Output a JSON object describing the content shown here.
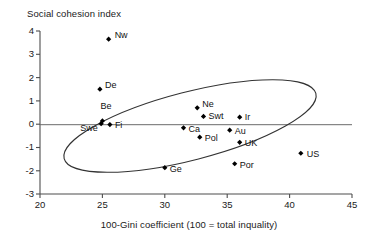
{
  "chart_data": {
    "type": "scatter",
    "title": "",
    "ylabel": "Social cohesion index",
    "xlabel": "100-Gini coefficient (100 = total inquality)",
    "xlim": [
      20,
      45
    ],
    "ylim": [
      -3,
      4
    ],
    "xticks": [
      "20",
      "25",
      "30",
      "35",
      "40",
      "45"
    ],
    "yticks": [
      "4",
      "3",
      "2",
      "1",
      "0",
      "-1",
      "-2",
      "-3"
    ],
    "grid": false,
    "legend": "none",
    "zero_line": true,
    "annotation": "ellipse enclosing the main cluster (excludes Nw)",
    "points": [
      {
        "label": "Nw",
        "x": 25.5,
        "y": 3.65,
        "label_dx": 6,
        "label_dy": -4
      },
      {
        "label": "De",
        "x": 24.8,
        "y": 1.5,
        "label_dx": 5,
        "label_dy": -4
      },
      {
        "label": "Be",
        "x": 25.0,
        "y": 0.14,
        "label_dx": -2,
        "label_dy": -15
      },
      {
        "label": "Swe",
        "x": 24.9,
        "y": 0.02,
        "label_dx": -21,
        "label_dy": 4
      },
      {
        "label": "Fi",
        "x": 25.6,
        "y": -0.02,
        "label_dx": 5,
        "label_dy": 0
      },
      {
        "label": "Ne",
        "x": 32.6,
        "y": 0.7,
        "label_dx": 5,
        "label_dy": -4
      },
      {
        "label": "Swt",
        "x": 33.1,
        "y": 0.33,
        "label_dx": 5,
        "label_dy": 0
      },
      {
        "label": "Ir",
        "x": 36.0,
        "y": 0.3,
        "label_dx": 5,
        "label_dy": 0
      },
      {
        "label": "Ca",
        "x": 31.5,
        "y": -0.16,
        "label_dx": 5,
        "label_dy": 1
      },
      {
        "label": "Au",
        "x": 35.2,
        "y": -0.26,
        "label_dx": 5,
        "label_dy": 1
      },
      {
        "label": "Pol",
        "x": 32.8,
        "y": -0.56,
        "label_dx": 5,
        "label_dy": 1
      },
      {
        "label": "UK",
        "x": 36.0,
        "y": -0.78,
        "label_dx": 5,
        "label_dy": 1
      },
      {
        "label": "Ge",
        "x": 30.0,
        "y": -1.87,
        "label_dx": 5,
        "label_dy": 1
      },
      {
        "label": "Por",
        "x": 35.6,
        "y": -1.7,
        "label_dx": 5,
        "label_dy": 1
      },
      {
        "label": "US",
        "x": 40.9,
        "y": -1.25,
        "label_dx": 6,
        "label_dy": 1
      }
    ],
    "colors": {
      "marker": "#000000",
      "axis": "#4d4d4d",
      "text": "#1a1a1a",
      "ellipse": "#333333",
      "background": "#ffffff"
    }
  }
}
